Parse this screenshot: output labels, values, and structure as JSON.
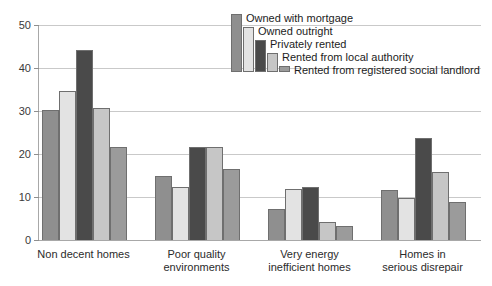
{
  "chart_data": {
    "type": "bar",
    "title": "",
    "subtitle": "",
    "xlabel": "",
    "ylabel": "",
    "ylim": [
      0,
      50
    ],
    "yticks": [
      0,
      10,
      20,
      30,
      40,
      50
    ],
    "ytick_labels": [
      "0",
      "10",
      "20",
      "30",
      "40",
      "50"
    ],
    "grid": true,
    "legend_position": "top-center-staircase",
    "categories": [
      "Non decent homes",
      "Poor quality\nenvironments",
      "Very energy\ninefficient homes",
      "Homes in\nserious disrepair"
    ],
    "series": [
      {
        "name": "Owned with mortgage",
        "color": "#8f8f8f",
        "values": [
          30.2,
          15.0,
          7.2,
          11.7
        ]
      },
      {
        "name": "Owned outright",
        "color": "#e3e3e3",
        "values": [
          34.7,
          12.3,
          11.8,
          9.8
        ]
      },
      {
        "name": "Privately rented",
        "color": "#4a4a4a",
        "values": [
          44.2,
          21.7,
          12.3,
          23.7
        ]
      },
      {
        "name": "Rented from local authority",
        "color": "#c6c6c6",
        "values": [
          30.8,
          21.7,
          4.1,
          15.8
        ]
      },
      {
        "name": "Rented from registered social landlord",
        "color": "#9b9b9b",
        "values": [
          21.6,
          16.4,
          3.2,
          8.8
        ]
      }
    ]
  },
  "axis": {
    "y_tick_0": "0",
    "y_tick_1": "10",
    "y_tick_2": "20",
    "y_tick_3": "30",
    "y_tick_4": "40",
    "y_tick_5": "50"
  },
  "xlabels": {
    "cat_0": "Non decent homes",
    "cat_1": "Poor quality\nenvironments",
    "cat_2": "Very energy\ninefficient homes",
    "cat_3": "Homes in\nserious disrepair"
  },
  "legend": {
    "item_0": "Owned with mortgage",
    "item_1": "Owned outright",
    "item_2": "Privately rented",
    "item_3": "Rented from local authority",
    "item_4": "Rented from registered social landlord"
  },
  "colors": {
    "series_1": "#8f8f8f",
    "series_2": "#e3e3e3",
    "series_3": "#4a4a4a",
    "series_4": "#c6c6c6",
    "series_5": "#9b9b9b",
    "gridline": "#c9c9c9",
    "axis": "#a8a8a8",
    "bar_outline": "#6f6f6f"
  }
}
